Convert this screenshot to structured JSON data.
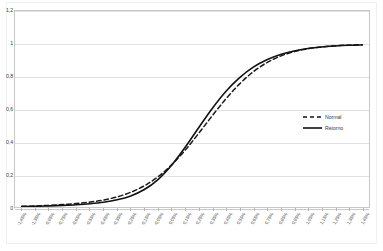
{
  "chart_data": {
    "type": "line",
    "title": "",
    "subtitle": "",
    "xlabel": "",
    "ylabel": "",
    "ylim": [
      0,
      1.2
    ],
    "ytick_labels": [
      "1,2",
      "1",
      "0,8",
      "0,6",
      "0,4",
      "0,2",
      "0"
    ],
    "ytick_values": [
      1.2,
      1.0,
      0.8,
      0.6,
      0.4,
      0.2,
      0.0
    ],
    "grid": true,
    "legend_position": "right",
    "x": [
      -1.45,
      -1.35,
      -0.95,
      -0.75,
      -0.65,
      -0.55,
      -0.45,
      -0.35,
      -0.25,
      -0.15,
      -0.05,
      0.05,
      0.15,
      0.25,
      0.35,
      0.45,
      0.55,
      0.65,
      0.75,
      0.85,
      0.95,
      1.05,
      1.15,
      1.25,
      1.35,
      1.45
    ],
    "xtick_labels": [
      "-1,45%",
      "-1,35%",
      "-0,95%",
      "-0,75%",
      "-0,65%",
      "-0,55%",
      "-0,45%",
      "-0,35%",
      "-0,25%",
      "-0,15%",
      "-0,05%",
      "0,05%",
      "0,15%",
      "0,25%",
      "0,35%",
      "0,45%",
      "0,55%",
      "0,65%",
      "0,75%",
      "0,85%",
      "0,95%",
      "1,05%",
      "1,15%",
      "1,25%",
      "1,35%",
      "1,45%"
    ],
    "series": [
      {
        "name": "Normal",
        "style": "dashed",
        "color": "#1a1a1a",
        "values": [
          0.004,
          0.006,
          0.01,
          0.015,
          0.021,
          0.03,
          0.043,
          0.062,
          0.09,
          0.13,
          0.185,
          0.258,
          0.348,
          0.452,
          0.56,
          0.663,
          0.754,
          0.828,
          0.884,
          0.924,
          0.951,
          0.969,
          0.98,
          0.987,
          0.991,
          0.994
        ]
      },
      {
        "name": "Retorno",
        "style": "solid",
        "color": "#111111",
        "values": [
          0.003,
          0.004,
          0.007,
          0.01,
          0.014,
          0.02,
          0.029,
          0.044,
          0.068,
          0.107,
          0.168,
          0.256,
          0.366,
          0.487,
          0.605,
          0.709,
          0.792,
          0.856,
          0.901,
          0.933,
          0.955,
          0.97,
          0.98,
          0.986,
          0.99,
          0.992
        ]
      }
    ]
  },
  "legend": {
    "items": [
      {
        "label": "Normal",
        "style": "dashed"
      },
      {
        "label": "Retorno",
        "style": "solid"
      }
    ]
  }
}
